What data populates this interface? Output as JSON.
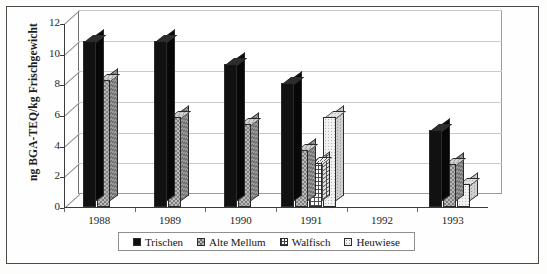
{
  "chart_data": {
    "type": "bar",
    "title": "",
    "xlabel": "",
    "ylabel": "ng BGA-TEQ/kg Frischgewicht",
    "categories": [
      "1988",
      "1989",
      "1990",
      "1991",
      "1992",
      "1993"
    ],
    "ylim": [
      0,
      12
    ],
    "yticks": [
      0,
      2,
      4,
      6,
      8,
      10,
      12
    ],
    "ytick_labels": [
      "0",
      "2",
      "4",
      "6",
      "8",
      "10",
      "12"
    ],
    "grid": true,
    "legend_position": "bottom",
    "style": "3d-column",
    "series": [
      {
        "name": "Trischen",
        "pattern": "solid-black",
        "color": "#111111",
        "values": [
          10.8,
          10.8,
          9.3,
          8.1,
          null,
          5.0
        ]
      },
      {
        "name": "Alte Mellum",
        "pattern": "checker-gray",
        "color": "#b9b9b9",
        "values": [
          8.3,
          5.9,
          5.4,
          3.7,
          null,
          2.8
        ]
      },
      {
        "name": "Walfisch",
        "pattern": "grid-crosshatch",
        "color": "#fbfbfb",
        "values": [
          null,
          null,
          null,
          2.9,
          null,
          null
        ]
      },
      {
        "name": "Heuwiese",
        "pattern": "fine-dots-light",
        "color": "#f2f2f2",
        "values": [
          null,
          null,
          null,
          5.9,
          null,
          1.5
        ]
      }
    ]
  },
  "legend": {
    "items": [
      {
        "label": "Trischen",
        "swatch": "solid-black-swatch"
      },
      {
        "label": "Alte Mellum",
        "swatch": "checker-gray-swatch"
      },
      {
        "label": "Walfisch",
        "swatch": "grid-crosshatch-swatch"
      },
      {
        "label": "Heuwiese",
        "swatch": "fine-dots-swatch"
      }
    ]
  }
}
